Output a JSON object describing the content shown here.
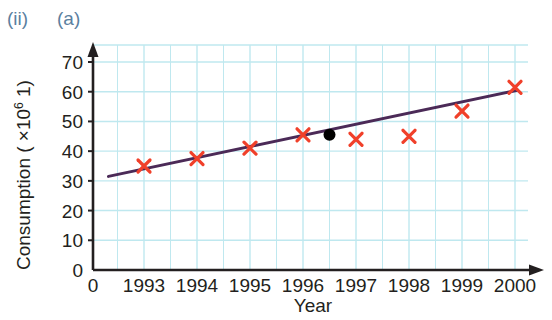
{
  "figure": {
    "part_label": "(ii)",
    "subpart_label": "(a)"
  },
  "chart_data": {
    "type": "scatter",
    "title": "",
    "xlabel": "Year",
    "ylabel_prefix": "Consumption ( ×10",
    "ylabel_exponent": "6",
    "ylabel_suffix": " 1)",
    "ylabel_full": "Consumption ( ×10^6 1)",
    "xlim": [
      1992,
      2000.4
    ],
    "ylim": [
      0,
      75
    ],
    "x_ticks": [
      "1993",
      "1994",
      "1995",
      "1996",
      "1997",
      "1998",
      "1999",
      "2000"
    ],
    "x_tick_values": [
      1993,
      1994,
      1995,
      1996,
      1997,
      1998,
      1999,
      2000
    ],
    "x_origin_label": "0",
    "y_ticks": [
      "0",
      "10",
      "20",
      "30",
      "40",
      "50",
      "60",
      "70"
    ],
    "y_tick_values": [
      0,
      10,
      20,
      30,
      40,
      50,
      60,
      70
    ],
    "grid": true,
    "grid_minor_x": true,
    "legend": "none",
    "series": [
      {
        "name": "Consumption data",
        "marker": "x",
        "color": "#f0402a",
        "x": [
          1993,
          1994,
          1995,
          1996,
          1997,
          1998,
          1999,
          2000
        ],
        "values": [
          35,
          37.5,
          41,
          45.5,
          44,
          45,
          53.5,
          61.5
        ]
      },
      {
        "name": "Mean point",
        "marker": "filled-circle",
        "color": "#000000",
        "x": [
          1996.5
        ],
        "values": [
          45.5
        ]
      },
      {
        "name": "Line of best fit",
        "marker": "line",
        "color": "#4b2a57",
        "x": [
          1992.33,
          2000.05
        ],
        "values": [
          31.5,
          60.5
        ]
      }
    ]
  },
  "colors": {
    "grid": "#bfe8ef",
    "axis": "#231f20",
    "marker": "#f0402a",
    "trend_line": "#4b2a57",
    "mean_point": "#000000",
    "corner_label": "#5b7fa0"
  }
}
